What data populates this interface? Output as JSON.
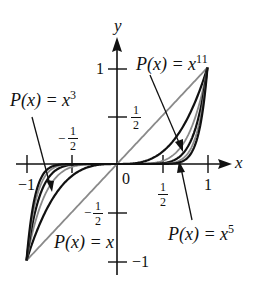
{
  "chart_data": {
    "type": "line",
    "title": "",
    "xlabel": "x",
    "ylabel": "y",
    "xlim": [
      -1,
      1
    ],
    "ylim": [
      -1,
      1
    ],
    "grid": false,
    "x_ticks": [
      "-1",
      "-1/2",
      "0",
      "1/2",
      "1"
    ],
    "y_ticks": [
      "-1",
      "-1/2",
      "1/2",
      "1"
    ],
    "origin_label": "0",
    "series": [
      {
        "name": "P(x) = x",
        "exponent": 1,
        "color": "#8a8a8a"
      },
      {
        "name": "P(x) = x^3",
        "exponent": 3,
        "color": "#111111"
      },
      {
        "name": "P(x) = x^5",
        "exponent": 5,
        "color": "#8a8a8a"
      },
      {
        "name": "P(x) = x^7",
        "exponent": 7,
        "color": "#111111"
      },
      {
        "name": "P(x) = x^9",
        "exponent": 9,
        "color": "#8a8a8a"
      },
      {
        "name": "P(x) = x^11",
        "exponent": 11,
        "color": "#111111"
      }
    ],
    "annotations": [
      {
        "text": "P(x) = x^3",
        "points_to": "x^3 curve at x≈-0.75"
      },
      {
        "text": "P(x) = x^11",
        "points_to": "x^11 curve at x≈0.82"
      },
      {
        "text": "P(x) = x^5",
        "points_to": "x^5 curve at x≈0.7"
      },
      {
        "text": "P(x) = x",
        "points_to": "line y=x"
      }
    ]
  },
  "labels": {
    "y_axis": "y",
    "x_axis": "x",
    "one": "1",
    "neg_one": "−1",
    "zero": "0",
    "half_num": "1",
    "half_den": "2",
    "minus": "−",
    "p3_prefix": "P(x) = x",
    "p3_exp": "3",
    "p11_prefix": "P(x) = x",
    "p11_exp": "11",
    "p5_prefix": "P(x) = x",
    "p5_exp": "5",
    "p1": "P(x) = x"
  }
}
